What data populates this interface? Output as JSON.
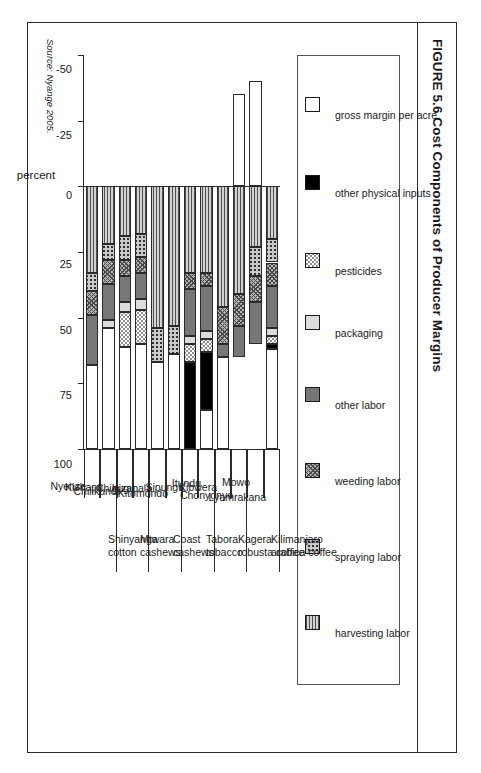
{
  "figure": {
    "title": "FIGURE 5.6 Cost Components of Producer Margins",
    "source": "Source: Nyange 2005."
  },
  "legend": {
    "items": [
      {
        "label": "gross margin per acre",
        "key": "gross",
        "color": "#ffffff"
      },
      {
        "label": "other physical inputs",
        "key": "opi",
        "color": "#000000"
      },
      {
        "label": "pesticides",
        "key": "pest",
        "color": "#8e8e8e"
      },
      {
        "label": "packaging",
        "key": "pack",
        "color": "#dcdcdc"
      },
      {
        "label": "other labor",
        "key": "olab",
        "color": "#777777"
      },
      {
        "label": "weeding labor",
        "key": "weed",
        "color": "#b4b4b4"
      },
      {
        "label": "spraying labor",
        "key": "spray",
        "color": "#c9c9c9"
      },
      {
        "label": "harvesting labor",
        "key": "harv",
        "color": "#d2d2d2"
      }
    ]
  },
  "axis": {
    "title": "percent",
    "ticks": [
      "100",
      "75",
      "50",
      "25",
      "0",
      "-25",
      "-50"
    ],
    "tick_values": [
      100,
      75,
      50,
      25,
      0,
      -25,
      -50
    ],
    "min": -50,
    "max": 100
  },
  "groups": [
    {
      "region": "Kilimanjaro",
      "crop": "arabica coffee",
      "villages": [
        "Lyamrakana",
        "Mowo"
      ]
    },
    {
      "region": "Kagera",
      "crop": "robusta coffee",
      "villages": [
        "Chonyonyo",
        "Kibwera"
      ]
    },
    {
      "region": "Tabora",
      "crop": "tobacco",
      "villages": [
        "Itundu",
        "Sipungu"
      ]
    },
    {
      "region": "Coast",
      "crop": "cashews",
      "villages": [
        "Kitomondo",
        "Kizapala"
      ]
    },
    {
      "region": "Mtwara",
      "crop": "cashews",
      "villages": [
        "Chigugu",
        "Chilikundi"
      ]
    },
    {
      "region": "Shinyanga",
      "crop": "cotton",
      "villages": [
        "Kishapu",
        "Nyenze"
      ]
    }
  ],
  "chart_data": {
    "type": "bar",
    "title": "FIGURE 5.6 Cost Components of Producer Margins",
    "subtitle": "",
    "orientation": "horizontal-stacked",
    "stacked": true,
    "xlabel": "percent",
    "ylabel": "",
    "xlim": [
      -50,
      100
    ],
    "grid": false,
    "legend_position": "top",
    "categories": [
      "Lyamrakana",
      "Mowo",
      "Chonyonyo",
      "Kibwera",
      "Itundu",
      "Sipungu",
      "Kitomondo",
      "Kizapala",
      "Chigugu",
      "Chilikundi",
      "Kishapu",
      "Nyenze"
    ],
    "category_groups": [
      "Kilimanjaro arabica coffee",
      "Kilimanjaro arabica coffee",
      "Kagera robusta coffee",
      "Kagera robusta coffee",
      "Tabora tobacco",
      "Tabora tobacco",
      "Coast cashews",
      "Coast cashews",
      "Mtwara cashews",
      "Mtwara cashews",
      "Shinyanga cotton",
      "Shinyanga cotton"
    ],
    "series": [
      {
        "name": "gross margin per acre",
        "key": "gross",
        "values": [
          38,
          -40,
          -35,
          35,
          15,
          0,
          36,
          33,
          40,
          39,
          46,
          32
        ]
      },
      {
        "name": "other physical inputs",
        "key": "opi",
        "values": [
          2,
          0,
          0,
          0,
          22,
          33,
          0,
          0,
          0,
          0,
          0,
          0
        ]
      },
      {
        "name": "pesticides",
        "key": "pest",
        "values": [
          3,
          0,
          0,
          0,
          5,
          7,
          0,
          0,
          13,
          13,
          0,
          0
        ]
      },
      {
        "name": "packaging",
        "key": "pack",
        "values": [
          3,
          0,
          0,
          0,
          3,
          3,
          0,
          0,
          4,
          4,
          3,
          0
        ]
      },
      {
        "name": "other labor",
        "key": "olab",
        "values": [
          16,
          16,
          12,
          5,
          17,
          18,
          0,
          0,
          10,
          10,
          14,
          19
        ]
      },
      {
        "name": "weeding labor",
        "key": "weed",
        "values": [
          9,
          10,
          12,
          14,
          5,
          6,
          0,
          0,
          6,
          6,
          9,
          9
        ]
      },
      {
        "name": "spraying labor",
        "key": "spray",
        "values": [
          9,
          11,
          0,
          0,
          0,
          0,
          11,
          13,
          9,
          9,
          6,
          7
        ]
      },
      {
        "name": "harvesting labor",
        "key": "harv",
        "values": [
          20,
          23,
          41,
          46,
          33,
          33,
          53,
          54,
          18,
          19,
          22,
          33
        ]
      }
    ]
  }
}
